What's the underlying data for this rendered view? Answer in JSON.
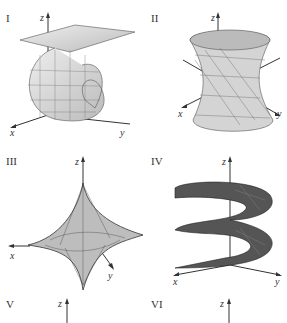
{
  "figure": {
    "panels": [
      {
        "label": "I",
        "axes": {
          "x": "x",
          "y": "y",
          "z": "z"
        },
        "surface": "twisted-loop-ribbon"
      },
      {
        "label": "II",
        "axes": {
          "x": "x",
          "y": "y",
          "z": "z"
        },
        "surface": "hyperboloid-twisted"
      },
      {
        "label": "III",
        "axes": {
          "x": "x",
          "y": "y",
          "z": "z"
        },
        "surface": "astroidal-star"
      },
      {
        "label": "IV",
        "axes": {
          "x": "x",
          "y": "y",
          "z": "z"
        },
        "surface": "helicoid-spiral"
      },
      {
        "label": "V",
        "axes": {
          "z": "z"
        },
        "surface": "partial"
      },
      {
        "label": "VI",
        "axes": {
          "z": "z"
        },
        "surface": "partial"
      }
    ]
  }
}
